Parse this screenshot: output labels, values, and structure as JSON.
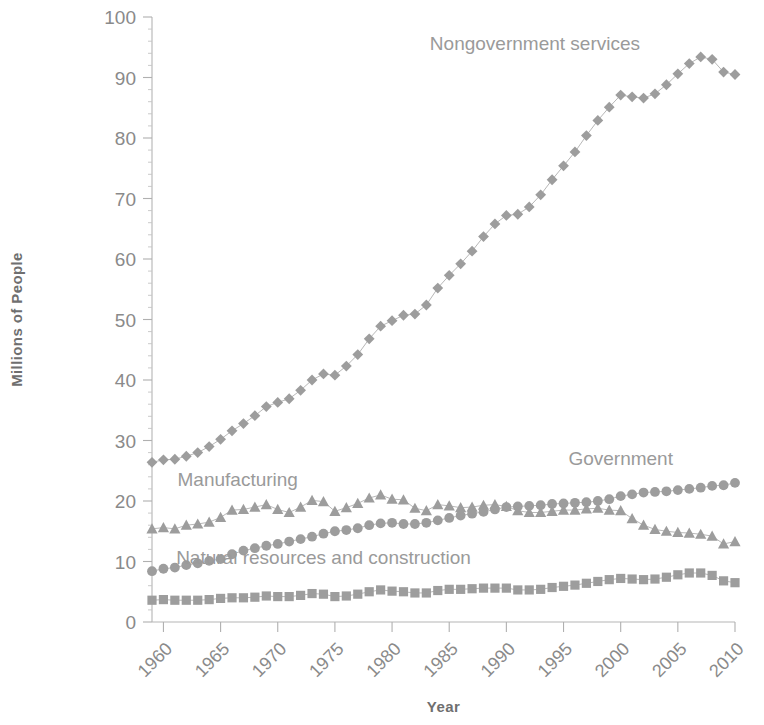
{
  "chart_data": {
    "type": "line",
    "title": "",
    "xlabel": "Year",
    "ylabel": "Millions of People",
    "xlim": [
      1959,
      2010
    ],
    "ylim": [
      0,
      100
    ],
    "grid": false,
    "legend_position": "inline-annotations",
    "y_ticks": [
      0,
      10,
      20,
      30,
      40,
      50,
      60,
      70,
      80,
      90,
      100
    ],
    "y_tick_labels": [
      "0",
      "10",
      "20",
      "30",
      "40",
      "50",
      "60",
      "70",
      "80",
      "90",
      "100"
    ],
    "y_minor_tick_step": 2,
    "x_ticks": [
      1960,
      1965,
      1970,
      1975,
      1980,
      1985,
      1990,
      1995,
      2000,
      2005,
      2010
    ],
    "x_tick_labels": [
      "1960",
      "1965",
      "1970",
      "1975",
      "1980",
      "1985",
      "1990",
      "1995",
      "2000",
      "2005",
      "2010"
    ],
    "x_tick_label_rotation": -45,
    "x": [
      1959,
      1960,
      1961,
      1962,
      1963,
      1964,
      1965,
      1966,
      1967,
      1968,
      1969,
      1970,
      1971,
      1972,
      1973,
      1974,
      1975,
      1976,
      1977,
      1978,
      1979,
      1980,
      1981,
      1982,
      1983,
      1984,
      1985,
      1986,
      1987,
      1988,
      1989,
      1990,
      1991,
      1992,
      1993,
      1994,
      1995,
      1996,
      1997,
      1998,
      1999,
      2000,
      2001,
      2002,
      2003,
      2004,
      2005,
      2006,
      2007,
      2008,
      2009,
      2010
    ],
    "series": [
      {
        "name": "Nongovernment services",
        "marker": "diamond",
        "color": "#9d9d9d",
        "label_x": 1992.5,
        "label_y": 94.5,
        "values": [
          26.4,
          26.8,
          26.9,
          27.4,
          28.0,
          29.0,
          30.2,
          31.6,
          32.8,
          34.1,
          35.6,
          36.3,
          36.9,
          38.3,
          40.0,
          41.0,
          40.8,
          42.3,
          44.2,
          46.8,
          48.9,
          49.8,
          50.7,
          50.9,
          52.4,
          55.2,
          57.3,
          59.2,
          61.3,
          63.7,
          65.8,
          67.2,
          67.4,
          68.6,
          70.6,
          73.1,
          75.4,
          77.7,
          80.4,
          82.9,
          85.1,
          87.1,
          86.8,
          86.6,
          87.3,
          88.8,
          90.6,
          92.3,
          93.4,
          93.0,
          90.9,
          90.5
        ]
      },
      {
        "name": "Manufacturing",
        "marker": "triangle",
        "color": "#9d9d9d",
        "label_x": 1966.5,
        "label_y": 22.4,
        "values": [
          15.4,
          15.6,
          15.4,
          16.0,
          16.2,
          16.5,
          17.3,
          18.5,
          18.6,
          19.0,
          19.4,
          18.6,
          18.1,
          19.0,
          20.1,
          19.9,
          18.3,
          18.9,
          19.6,
          20.5,
          21.0,
          20.3,
          20.2,
          18.8,
          18.4,
          19.4,
          19.2,
          18.9,
          19.0,
          19.3,
          19.4,
          19.1,
          18.4,
          18.1,
          18.1,
          18.3,
          18.5,
          18.5,
          18.7,
          18.8,
          18.5,
          18.4,
          17.1,
          16.0,
          15.3,
          15.0,
          14.8,
          14.7,
          14.5,
          14.2,
          12.9,
          13.3
        ]
      },
      {
        "name": "Government",
        "marker": "circle",
        "color": "#9d9d9d",
        "label_x": 2000.0,
        "label_y": 25.9,
        "values": [
          8.4,
          8.8,
          9.0,
          9.4,
          9.7,
          10.1,
          10.4,
          11.2,
          11.8,
          12.2,
          12.6,
          12.9,
          13.3,
          13.7,
          14.1,
          14.6,
          15.0,
          15.2,
          15.5,
          16.0,
          16.3,
          16.4,
          16.2,
          16.2,
          16.4,
          16.8,
          17.2,
          17.6,
          17.9,
          18.2,
          18.6,
          19.0,
          19.1,
          19.2,
          19.3,
          19.5,
          19.6,
          19.7,
          19.8,
          20.0,
          20.3,
          20.8,
          21.1,
          21.4,
          21.5,
          21.6,
          21.8,
          22.0,
          22.2,
          22.5,
          22.6,
          23.0
        ]
      },
      {
        "name": "Natural resources and construction",
        "marker": "square",
        "color": "#9d9d9d",
        "label_x": 1974.0,
        "label_y": 9.6,
        "values": [
          3.6,
          3.7,
          3.6,
          3.6,
          3.6,
          3.7,
          3.9,
          4.0,
          4.0,
          4.1,
          4.3,
          4.2,
          4.2,
          4.4,
          4.7,
          4.6,
          4.2,
          4.3,
          4.6,
          5.0,
          5.3,
          5.1,
          5.0,
          4.8,
          4.8,
          5.2,
          5.4,
          5.4,
          5.5,
          5.6,
          5.6,
          5.6,
          5.3,
          5.3,
          5.4,
          5.7,
          5.9,
          6.1,
          6.4,
          6.7,
          7.0,
          7.2,
          7.1,
          7.0,
          7.1,
          7.4,
          7.8,
          8.1,
          8.1,
          7.7,
          6.8,
          6.5
        ]
      }
    ]
  },
  "axes": {
    "x_title": "Year",
    "y_title": "Millions of People"
  }
}
